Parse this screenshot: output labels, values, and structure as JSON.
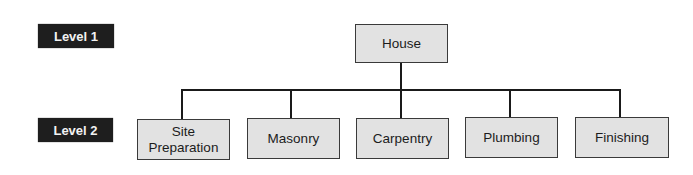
{
  "diagram": {
    "type": "hierarchy-tree",
    "levels": [
      {
        "label": "Level 1"
      },
      {
        "label": "Level 2"
      }
    ],
    "root": {
      "label": "House"
    },
    "children": [
      {
        "label": "Site Preparation",
        "line1": "Site",
        "line2": "Preparation"
      },
      {
        "label": "Masonry"
      },
      {
        "label": "Carpentry"
      },
      {
        "label": "Plumbing"
      },
      {
        "label": "Finishing"
      }
    ],
    "colors": {
      "badge_bg": "#1e1e1e",
      "badge_text": "#f2f2f2",
      "node_fill": "#e2e2e2",
      "node_border": "#3a3a3a",
      "connector": "#1a1a1a"
    }
  }
}
